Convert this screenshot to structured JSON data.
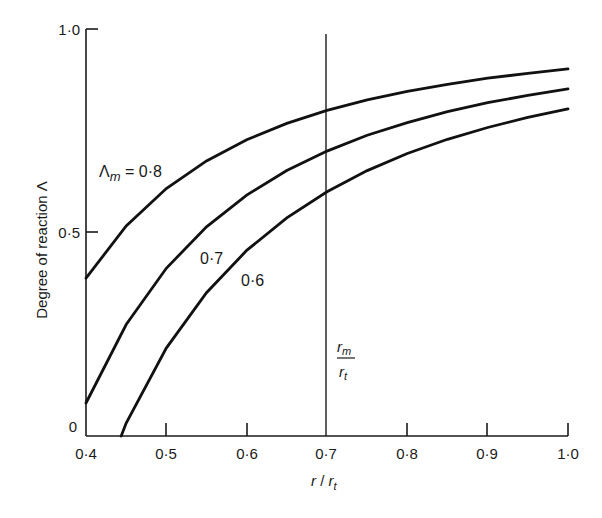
{
  "chart_data": {
    "type": "line",
    "title": "",
    "xlabel": "r / r_t",
    "ylabel": "Degree of reaction Λ",
    "xlim": [
      0.4,
      1.0
    ],
    "ylim": [
      0,
      1.0
    ],
    "grid": false,
    "x_ticks": [
      "0·4",
      "0·5",
      "0·6",
      "0·7",
      "0·8",
      "0·9",
      "1·0"
    ],
    "x_tick_values": [
      0.4,
      0.5,
      0.6,
      0.7,
      0.8,
      0.9,
      1.0
    ],
    "y_ticks": [
      "0",
      "0·5",
      "1·0"
    ],
    "y_tick_values": [
      0,
      0.5,
      1.0
    ],
    "x": [
      0.4,
      0.45,
      0.5,
      0.55,
      0.6,
      0.65,
      0.7,
      0.75,
      0.8,
      0.85,
      0.9,
      0.95,
      1.0
    ],
    "series": [
      {
        "name": "Λm = 0·8",
        "label": "Λm = 0·8",
        "values": [
          0.388,
          0.516,
          0.608,
          0.676,
          0.728,
          0.768,
          0.8,
          0.826,
          0.847,
          0.864,
          0.879,
          0.891,
          0.902
        ]
      },
      {
        "name": "0·7",
        "label": "0·7",
        "values": [
          0.081,
          0.274,
          0.412,
          0.514,
          0.592,
          0.652,
          0.7,
          0.739,
          0.77,
          0.797,
          0.819,
          0.837,
          0.853
        ]
      },
      {
        "name": "0·6",
        "label": "0·6",
        "values": [
          -0.225,
          0.032,
          0.216,
          0.352,
          0.456,
          0.536,
          0.6,
          0.652,
          0.694,
          0.729,
          0.758,
          0.783,
          0.804
        ]
      }
    ],
    "reference_line": {
      "x": 0.7,
      "label_numerator": "r_m",
      "label_denominator": "r_t"
    },
    "annotations": [
      "Λm = 0·8",
      "0·7",
      "0·6",
      "r_m / r_t"
    ]
  },
  "labels": {
    "ylabel": "Degree of reaction Λ",
    "xlabel_r": "r",
    "xlabel_slash": " / ",
    "xlabel_rt": "r",
    "xlabel_rt_sub": "t",
    "ref_num": "r",
    "ref_num_sub": "m",
    "ref_den": "r",
    "ref_den_sub": "t",
    "curve_08_lambda": "Λ",
    "curve_08_sub": "m",
    "curve_08_rest": " = 0·8",
    "curve_07": "0·7",
    "curve_06": "0·6",
    "xt0": "0·4",
    "xt1": "0·5",
    "xt2": "0·6",
    "xt3": "0·7",
    "xt4": "0·8",
    "xt5": "0·9",
    "xt6": "1·0",
    "yt0": "0",
    "yt1": "0·5",
    "yt2": "1·0"
  }
}
